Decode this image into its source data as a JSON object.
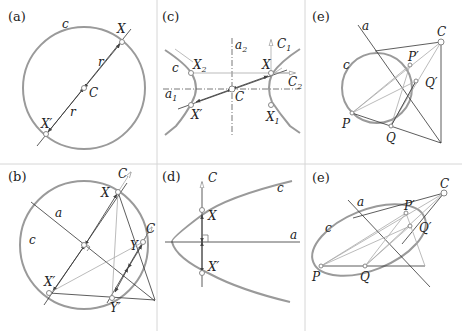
{
  "figure": {
    "width": 462,
    "height": 331,
    "colors": {
      "background": "#ffffff",
      "curve": "#9a9a9a",
      "line": "#333333",
      "light_line": "#aaaaaa",
      "divider": "#d6d6d6"
    },
    "panels": [
      {
        "id": "a",
        "label": "(a)",
        "title": "circle with central symmetry",
        "labels": {
          "curve": "c",
          "point1": "X",
          "point2": "X′",
          "center": "C",
          "radius1": "r",
          "radius2": "r"
        }
      },
      {
        "id": "c",
        "label": "(c)",
        "title": "hyperbola symmetries",
        "labels": {
          "curve": "c",
          "x2": "X",
          "x2sub": "2",
          "x": "X",
          "x1": "X",
          "x1sub": "1",
          "xp": "X′",
          "center": "C",
          "a1": "a",
          "a1sub": "1",
          "a2": "a",
          "a2sub": "2",
          "c1": "C",
          "c1sub": "1",
          "c2": "C",
          "c2sub": "2"
        }
      },
      {
        "id": "e1",
        "label": "(e)",
        "title": "circle perspective collineation",
        "labels": {
          "axis": "a",
          "curve": "c",
          "center": "C",
          "p": "P",
          "pp": "P′",
          "q": "Q",
          "qp": "Q′"
        }
      },
      {
        "id": "b",
        "label": "(b)",
        "title": "circle axial symmetry",
        "labels": {
          "curve": "c",
          "axis": "a",
          "x": "X",
          "xp": "X′",
          "y": "Y",
          "yp": "Y′",
          "c1": "C",
          "c2": "C"
        }
      },
      {
        "id": "d",
        "label": "(d)",
        "title": "parabola axial symmetry",
        "labels": {
          "curve": "c",
          "axis": "a",
          "center": "C",
          "x": "X",
          "xp": "X′"
        }
      },
      {
        "id": "e2",
        "label": "(e)",
        "title": "ellipse perspective collineation",
        "labels": {
          "axis": "a",
          "curve": "c",
          "center": "C",
          "p": "P",
          "pp": "P′",
          "q": "Q",
          "qp": "Q′"
        }
      }
    ]
  }
}
